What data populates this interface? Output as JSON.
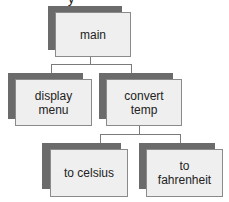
{
  "diagram": {
    "type": "hierarchy chart",
    "partial_top_text": "y",
    "nodes": {
      "main": {
        "label": "main"
      },
      "display_menu": {
        "label": "display\nmenu",
        "line1": "display",
        "line2": "menu"
      },
      "convert_temp": {
        "label": "convert\ntemp",
        "line1": "convert",
        "line2": "temp"
      },
      "to_celsius": {
        "label": "to celsius"
      },
      "to_fahrenheit": {
        "label": "to\nfahrenheit",
        "line1": "to",
        "line2": "fahrenheit"
      }
    },
    "edges": [
      {
        "from": "main",
        "to": "display_menu"
      },
      {
        "from": "main",
        "to": "convert_temp"
      },
      {
        "from": "convert_temp",
        "to": "to_celsius"
      },
      {
        "from": "convert_temp",
        "to": "to_fahrenheit"
      }
    ],
    "colors": {
      "shadow": "#6b6b6b",
      "box_fill": "#efefef",
      "box_border": "#8a8a8a",
      "connector": "#7a7a7a"
    }
  }
}
